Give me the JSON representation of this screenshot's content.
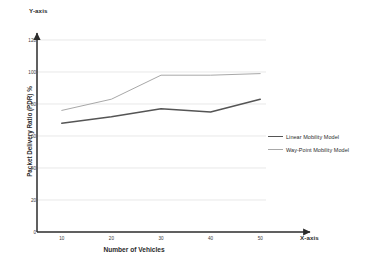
{
  "chart_data": {
    "type": "line",
    "title": "",
    "xlabel": "Number of Vehicles",
    "ylabel": "Packet Delivery Ratio (PDR) %",
    "x_axis_name": "X-axis",
    "y_axis_name": "Y-axis",
    "x": [
      10,
      20,
      30,
      40,
      50
    ],
    "xticklabels": [
      "10",
      "20",
      "30",
      "40",
      "50"
    ],
    "yticks": [
      0,
      20,
      40,
      60,
      80,
      100,
      120
    ],
    "yticklabels": [
      "0",
      "20",
      "40",
      "60",
      "80",
      "100",
      "120"
    ],
    "xlim": [
      5,
      55
    ],
    "ylim": [
      0,
      120
    ],
    "grid": "horizontal",
    "legend_position": "right",
    "series": [
      {
        "name": "Linear Mobility Model",
        "values": [
          68,
          72,
          77,
          75,
          83
        ],
        "color": "#555555",
        "width": 1.6
      },
      {
        "name": "Way-Point Mobility Model",
        "values": [
          76,
          83,
          98,
          98,
          99
        ],
        "color": "#a8a8a8",
        "width": 1.0
      }
    ]
  },
  "colors": {
    "axis": "#2b2b2b",
    "grid": "#d9d9d9",
    "background": "#ffffff"
  }
}
